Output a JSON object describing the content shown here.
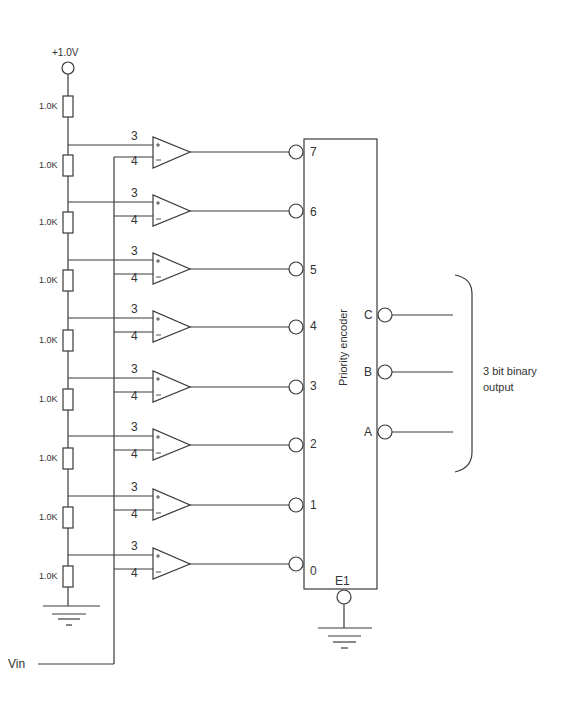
{
  "diagram": {
    "type": "flash ADC schematic",
    "supply": {
      "label": "+1.0V"
    },
    "input": {
      "label": "Vin"
    },
    "resistors": [
      {
        "label": "1.0K"
      },
      {
        "label": "1.0K"
      },
      {
        "label": "1.0K"
      },
      {
        "label": "1.0K"
      },
      {
        "label": "1.0K"
      },
      {
        "label": "1.0K"
      },
      {
        "label": "1.0K"
      },
      {
        "label": "1.0K"
      },
      {
        "label": "1.0K"
      }
    ],
    "comparators": [
      {
        "plus_pin": "3",
        "minus_pin": "4",
        "encoder_input": "7"
      },
      {
        "plus_pin": "3",
        "minus_pin": "4",
        "encoder_input": "6"
      },
      {
        "plus_pin": "3",
        "minus_pin": "4",
        "encoder_input": "5"
      },
      {
        "plus_pin": "3",
        "minus_pin": "4",
        "encoder_input": "4"
      },
      {
        "plus_pin": "3",
        "minus_pin": "4",
        "encoder_input": "3"
      },
      {
        "plus_pin": "3",
        "minus_pin": "4",
        "encoder_input": "2"
      },
      {
        "plus_pin": "3",
        "minus_pin": "4",
        "encoder_input": "1"
      },
      {
        "plus_pin": "3",
        "minus_pin": "4",
        "encoder_input": "0"
      }
    ],
    "encoder": {
      "label": "Priority encoder",
      "enable_pin": "E1",
      "outputs": [
        {
          "label": "C"
        },
        {
          "label": "B"
        },
        {
          "label": "A"
        }
      ]
    },
    "output_annotation": {
      "line1": "3 bit binary",
      "line2": "output"
    },
    "colors": {
      "line": "#3a3a3a",
      "text": "#333333",
      "background": "#ffffff"
    }
  }
}
